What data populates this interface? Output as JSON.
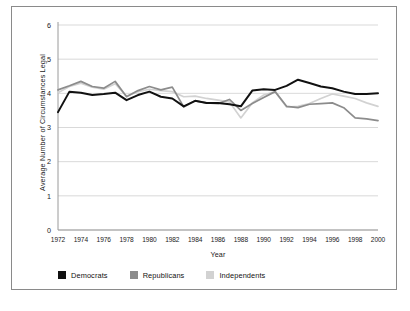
{
  "chart_data": {
    "type": "line",
    "title": "",
    "xlabel": "Year",
    "ylabel": "Average Number of Circumstances Legal",
    "xlim": [
      1972,
      2000
    ],
    "ylim": [
      0,
      6
    ],
    "yticks": [
      0,
      1,
      2,
      3,
      4,
      5,
      6
    ],
    "xticks": [
      1972,
      1974,
      1976,
      1978,
      1980,
      1982,
      1984,
      1986,
      1988,
      1990,
      1992,
      1994,
      1996,
      1998,
      2000
    ],
    "grid": "horizontal",
    "legend_position": "bottom-left",
    "x": [
      1972,
      1973,
      1974,
      1975,
      1976,
      1977,
      1978,
      1979,
      1980,
      1981,
      1982,
      1983,
      1984,
      1985,
      1986,
      1987,
      1988,
      1989,
      1990,
      1991,
      1992,
      1993,
      1994,
      1995,
      1996,
      1997,
      1998,
      1999,
      2000
    ],
    "series": [
      {
        "name": "Democrats",
        "color": "#111111",
        "values": [
          3.45,
          4.05,
          4.02,
          3.95,
          3.98,
          4.02,
          3.8,
          3.95,
          4.05,
          3.9,
          3.85,
          3.62,
          3.78,
          3.72,
          3.72,
          3.68,
          3.62,
          4.08,
          4.12,
          4.1,
          4.22,
          4.4,
          4.3,
          4.2,
          4.15,
          4.05,
          3.98,
          3.98,
          4.0
        ]
      },
      {
        "name": "Republicans",
        "color": "#8c8c8c",
        "values": [
          4.1,
          4.22,
          4.35,
          4.2,
          4.15,
          4.35,
          3.9,
          4.08,
          4.2,
          4.1,
          4.18,
          3.6,
          3.78,
          3.72,
          3.7,
          3.82,
          3.5,
          3.7,
          3.88,
          4.05,
          3.62,
          3.58,
          3.68,
          3.7,
          3.72,
          3.58,
          3.28,
          3.25,
          3.2
        ]
      },
      {
        "name": "Independents",
        "color": "#d2d2d2",
        "values": [
          4.02,
          4.2,
          4.3,
          4.18,
          4.12,
          4.28,
          3.92,
          4.05,
          4.12,
          4.08,
          4.05,
          3.9,
          3.92,
          3.85,
          3.8,
          3.75,
          3.28,
          3.72,
          3.95,
          4.05,
          3.6,
          3.62,
          3.7,
          3.85,
          3.98,
          3.92,
          3.85,
          3.72,
          3.62
        ]
      }
    ]
  },
  "axes": {
    "y_title": "Average Number of Circumstances Legal",
    "x_title": "Year",
    "y_tick_labels": [
      "6",
      "5",
      "4",
      "3",
      "2",
      "1",
      "0"
    ],
    "x_tick_labels": [
      "1972",
      "1974",
      "1976",
      "1978",
      "1980",
      "1982",
      "1984",
      "1986",
      "1988",
      "1990",
      "1992",
      "1994",
      "1996",
      "1998",
      "2000"
    ]
  },
  "legend": {
    "items": [
      {
        "label": "Democrats",
        "color": "#111111"
      },
      {
        "label": "Republicans",
        "color": "#8c8c8c"
      },
      {
        "label": "Independents",
        "color": "#d2d2d2"
      }
    ]
  },
  "style": {
    "frame_color": "#8a8a8a",
    "grid_color": "#cfcfcf",
    "axis_color": "#9a9a9a",
    "background": "#ffffff",
    "text_color": "#1a1a1a"
  }
}
